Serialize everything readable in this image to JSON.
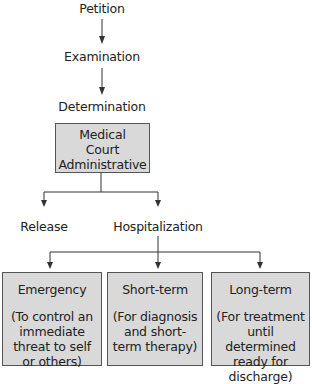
{
  "flow": {
    "steps": [
      "Petition",
      "Examination",
      "Determination"
    ],
    "determination_box": {
      "lines": [
        "Medical",
        "Court",
        "Administrative"
      ]
    },
    "outcomes": [
      "Release",
      "Hospitalization"
    ],
    "hospitalization_types": [
      {
        "title": "Emergency",
        "description": "(To control an immediate threat to self or others)"
      },
      {
        "title": "Short-term",
        "description": "(For diagnosis and short-term therapy)"
      },
      {
        "title": "Long-term",
        "description": "(For treatment until determined ready for discharge)"
      }
    ]
  },
  "colors": {
    "box_fill": "#d9d9d9",
    "box_border": "#555555",
    "line": "#333333"
  }
}
